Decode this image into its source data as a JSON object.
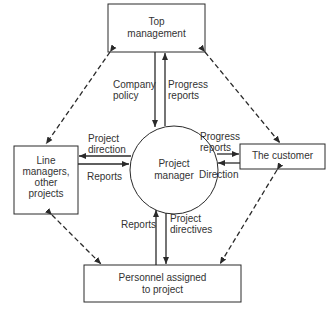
{
  "nodes": {
    "top_management": {
      "line1": "Top",
      "line2": "management"
    },
    "line_managers": {
      "line1": "Line",
      "line2": "managers,",
      "line3": "other",
      "line4": "projects"
    },
    "customer": {
      "label": "The customer"
    },
    "personnel": {
      "line1": "Personnel assigned",
      "line2": "to project"
    },
    "project_manager": {
      "line1": "Project",
      "line2": "manager"
    }
  },
  "edges": {
    "company_policy": {
      "line1": "Company",
      "line2": "policy"
    },
    "progress_reports_top": {
      "line1": "Progress",
      "line2": "reports"
    },
    "project_direction": {
      "line1": "Project",
      "line2": "direction"
    },
    "reports_left": {
      "label": "Reports"
    },
    "progress_reports_right": {
      "line1": "Progress",
      "line2": "reports"
    },
    "direction_right": {
      "label": "Direction"
    },
    "reports_bottom": {
      "label": "Reports"
    },
    "project_directives": {
      "line1": "Project",
      "line2": "directives"
    }
  },
  "colors": {
    "line": "#2a2a2a",
    "background": "#ffffff"
  }
}
